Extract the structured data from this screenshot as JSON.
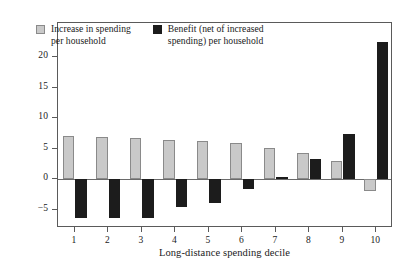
{
  "chart_data": {
    "type": "bar",
    "title": "",
    "subtitle": "",
    "xlabel": "Long-distance spending decile",
    "ylabel": "",
    "categories": [
      "1",
      "2",
      "3",
      "4",
      "5",
      "6",
      "7",
      "8",
      "9",
      "10"
    ],
    "series": [
      {
        "name": "Increase in spending\nper household",
        "key": "increase_in_spending",
        "color": "#c9c9c9",
        "values": [
          7.0,
          6.9,
          6.8,
          6.5,
          6.3,
          5.9,
          5.1,
          4.3,
          3.0,
          -2.0
        ]
      },
      {
        "name": "Benefit (net of increased\nspending) per household",
        "key": "benefit_net",
        "color": "#1c1c1c",
        "values": [
          -6.4,
          -6.4,
          -6.3,
          -4.5,
          -3.9,
          -1.6,
          0.4,
          3.3,
          7.4,
          22.5
        ]
      }
    ],
    "ylim": [
      -8.0,
      25.6
    ],
    "yticks": [
      -5,
      0,
      5,
      10,
      15,
      20
    ],
    "ytick_labels": [
      "−5",
      "0",
      "5",
      "10",
      "15",
      "20"
    ],
    "xtick_labels": [
      "1",
      "2",
      "3",
      "4",
      "5",
      "6",
      "7",
      "8",
      "9",
      "10"
    ],
    "grid": false,
    "legend_position": "top-left-inside",
    "zero_line": true
  },
  "legend": {
    "entries": [
      {
        "label": "Increase in spending\nper household",
        "swatch": "light-gray-square"
      },
      {
        "label": "Benefit (net of increased\nspending) per household",
        "swatch": "dark-square"
      }
    ]
  },
  "axes": {
    "x_axis_title": "Long-distance spending decile"
  }
}
